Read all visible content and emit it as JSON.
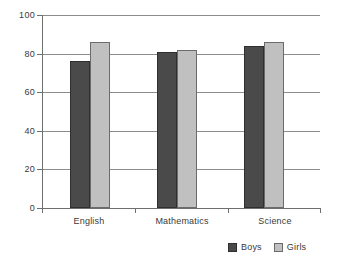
{
  "chart_data": {
    "type": "bar",
    "title": "",
    "subtitle": "",
    "xlabel": "",
    "ylabel": "",
    "categories": [
      "English",
      "Mathematics",
      "Science"
    ],
    "series": [
      {
        "name": "Boys",
        "color": "#4a4a4a",
        "values": [
          76,
          81,
          84
        ]
      },
      {
        "name": "Girls",
        "color": "#c0c0c0",
        "values": [
          86,
          82,
          86
        ]
      }
    ],
    "ylim": [
      0,
      100
    ],
    "yticks": [
      0,
      20,
      40,
      60,
      80,
      100
    ],
    "ytick_labels": [
      "0",
      "20",
      "40",
      "60",
      "80",
      "100"
    ],
    "grid": "horizontal",
    "legend_position": "bottom-right",
    "grouping": "clustered"
  },
  "axes": {
    "y_labels": [
      "100",
      "80",
      "60",
      "40",
      "20",
      "0"
    ],
    "x_labels": [
      "English",
      "Mathematics",
      "Science"
    ]
  },
  "legend": {
    "entries": [
      {
        "label": "Boys",
        "swatch": "boys-swatch"
      },
      {
        "label": "Girls",
        "swatch": "girls-swatch"
      }
    ]
  },
  "colors": {
    "boys": "#4a4a4a",
    "girls": "#c0c0c0",
    "gridline": "#8c8c8c",
    "axis": "#6e6e6e",
    "background": "#ffffff",
    "text": "#3a3a3a"
  }
}
